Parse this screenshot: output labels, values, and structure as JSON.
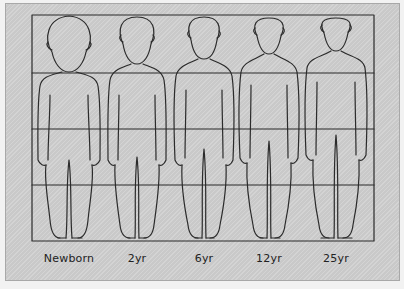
{
  "figure": {
    "grid_rows": 4,
    "figures": [
      {
        "label": "Newborn",
        "cx": 69
      },
      {
        "label": "2yr",
        "cx": 137
      },
      {
        "label": "6yr",
        "cx": 204
      },
      {
        "label": "12yr",
        "cx": 269
      },
      {
        "label": "25yr",
        "cx": 336
      }
    ]
  },
  "colors": {
    "background": "#cfcfcf",
    "line": "#2b2b2b",
    "outer": "#f2f2f2"
  }
}
